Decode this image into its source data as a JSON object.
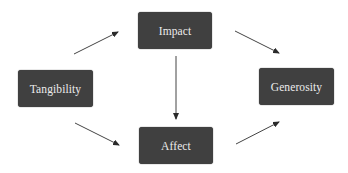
{
  "diagram": {
    "type": "flow",
    "nodes": [
      {
        "id": "tangibility",
        "label": "Tangibility"
      },
      {
        "id": "impact",
        "label": "Impact"
      },
      {
        "id": "affect",
        "label": "Affect"
      },
      {
        "id": "generosity",
        "label": "Generosity"
      }
    ],
    "edges": [
      {
        "from": "tangibility",
        "to": "impact"
      },
      {
        "from": "tangibility",
        "to": "affect"
      },
      {
        "from": "impact",
        "to": "affect"
      },
      {
        "from": "impact",
        "to": "generosity"
      },
      {
        "from": "affect",
        "to": "generosity"
      }
    ],
    "colors": {
      "node_fill": "#404040",
      "node_text": "#ececec",
      "edge": "#333333",
      "background": "#ffffff"
    }
  }
}
